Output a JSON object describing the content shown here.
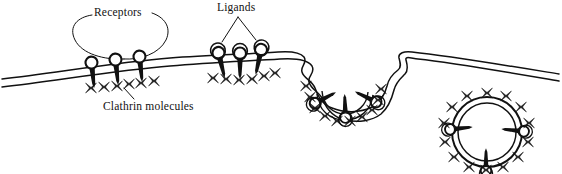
{
  "figure": {
    "background_color": "#ffffff",
    "ink_color": "#111111",
    "width": 562,
    "height": 174
  },
  "labels": {
    "receptors": "Receptors",
    "ligands": "Ligands",
    "clathrin": "Clathrin molecules"
  },
  "legend_targets": {
    "receptors_points_to": "receptor-head-circles-stage-1",
    "ligands_points_to": "ligand-circles-stage-2",
    "clathrin_points_to": "clathrin-x-molecules-stage-1"
  },
  "stages": [
    {
      "id": "stage-1-free-receptors",
      "caption_label": "Receptors",
      "receptor_count": 3,
      "ligand_count": 0,
      "clathrin_count": 6,
      "membrane": "flat-bilayer"
    },
    {
      "id": "stage-2-ligand-binding",
      "caption_label": "Ligands",
      "receptor_count": 3,
      "ligand_count": 3,
      "clathrin_count": 6,
      "membrane": "flat-bilayer"
    },
    {
      "id": "stage-3-coated-pit",
      "caption_label": "",
      "receptor_count": 3,
      "ligand_count": 3,
      "clathrin_count": 10,
      "membrane": "invaginated-pit"
    },
    {
      "id": "stage-4-coated-vesicle",
      "caption_label": "",
      "receptor_count": 3,
      "ligand_count": 3,
      "clathrin_count": 14,
      "membrane": "closed-vesicle"
    }
  ],
  "glyphs": {
    "clathrin": "x-shaped-triskelion",
    "receptor_head": "open-circle",
    "receptor_stalk": "filled-tapered-rod",
    "membrane": "two-parallel-lines"
  }
}
